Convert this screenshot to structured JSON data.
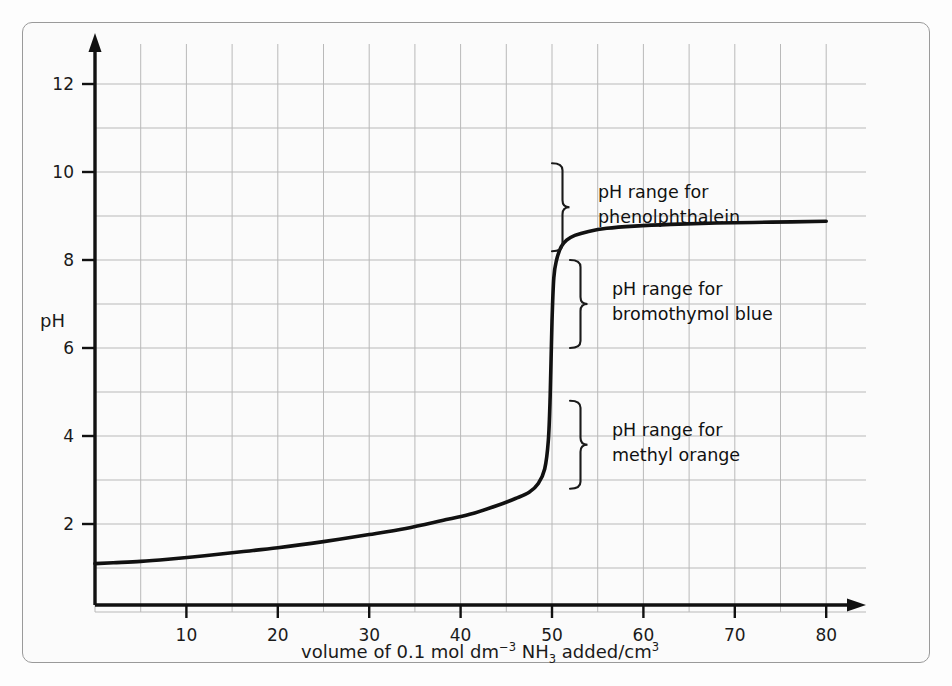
{
  "chart_data": {
    "type": "line",
    "title": "",
    "xlabel": "volume of 0.1 mol dm−3 NH3 added/cm3",
    "xlabel_parts": {
      "p1": "volume of 0.1 mol dm",
      "sup1": "−3",
      "p2": " NH",
      "sub1": "3",
      "p3": " added/cm",
      "sup2": "3"
    },
    "ylabel": "pH",
    "xlim": [
      0,
      85
    ],
    "ylim": [
      0,
      13.2
    ],
    "xticks": [
      10,
      20,
      30,
      40,
      50,
      60,
      70,
      80
    ],
    "yticks": [
      2,
      4,
      6,
      8,
      10,
      12
    ],
    "grid": true,
    "grid_x_step": 5,
    "grid_y_step": 1,
    "legend": "none",
    "series": [
      {
        "name": "pH titration curve",
        "description": "titration of strong acid with 0.1 mol dm-3 NH3, equivalence at 50 cm3",
        "x": [
          0,
          2,
          5,
          8,
          12,
          16,
          20,
          25,
          30,
          34,
          38,
          41,
          44,
          46,
          47.5,
          48.5,
          49.2,
          49.6,
          49.8,
          50.0,
          50.2,
          50.5,
          51,
          51.6,
          52.5,
          54,
          56,
          59,
          63,
          68,
          74,
          80
        ],
        "y": [
          1.1,
          1.12,
          1.15,
          1.2,
          1.28,
          1.37,
          1.46,
          1.6,
          1.76,
          1.9,
          2.08,
          2.22,
          2.42,
          2.58,
          2.72,
          2.92,
          3.25,
          3.9,
          4.9,
          6.6,
          7.6,
          8.0,
          8.3,
          8.45,
          8.56,
          8.65,
          8.72,
          8.77,
          8.81,
          8.84,
          8.86,
          8.88
        ]
      }
    ],
    "annotations": [
      {
        "id": "phenolphthalein",
        "line1": "pH range for",
        "line2": "phenolphthalein",
        "brace_ph_low": 8.2,
        "brace_ph_high": 10.2
      },
      {
        "id": "bromothymol-blue",
        "line1": "pH range for",
        "line2": "bromothymol blue",
        "brace_ph_low": 6.0,
        "brace_ph_high": 8.0
      },
      {
        "id": "methyl-orange",
        "line1": "pH range for",
        "line2": "methyl orange",
        "brace_ph_low": 2.8,
        "brace_ph_high": 4.8
      }
    ],
    "colors": {
      "curve": "#111111",
      "axis": "#111111",
      "grid": "#b9b9b9",
      "background": "#fbfbfb",
      "border": "#9a9a9a",
      "text": "#1a1a1a"
    }
  }
}
